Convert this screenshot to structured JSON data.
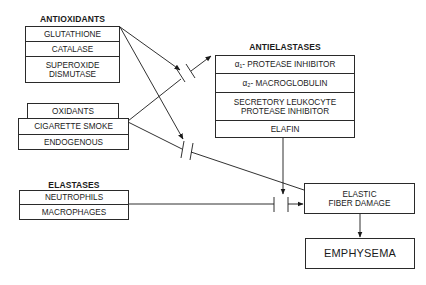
{
  "diagram": {
    "antioxidants": {
      "title": "ANTIOXIDANTS",
      "items": [
        "GLUTATHIONE",
        "CATALASE",
        "SUPEROXIDE\nDISMUTASE"
      ]
    },
    "oxidants": {
      "title": "OXIDANTS",
      "items": [
        "CIGARETTE  SMOKE",
        "ENDOGENOUS"
      ]
    },
    "elastases": {
      "title": "ELASTASES",
      "items": [
        "NEUTROPHILS",
        "MACROPHAGES"
      ]
    },
    "antielastases": {
      "title": "ANTIELASTASES",
      "items": [
        "α₁- PROTEASE  INHIBITOR",
        "α₂- MACROGLOBULIN",
        "SECRETORY  LEUKOCYTE\nPROTEASE  INHIBITOR",
        "ELAFIN"
      ]
    },
    "elastic_fiber_damage": {
      "label": "ELASTIC\nFIBER  DAMAGE"
    },
    "emphysema": {
      "label": "EMPHYSEMA"
    },
    "edges": [
      {
        "from": "antioxidants",
        "to": "oxidants-to-antielastases-link",
        "type": "inhibit"
      },
      {
        "from": "antioxidants",
        "to": "oxidants-to-elastic-fiber-link",
        "type": "inhibit"
      },
      {
        "from": "cigarette-smoke",
        "to": "antielastases",
        "type": "inhibited-arrow"
      },
      {
        "from": "cigarette-smoke",
        "to": "elastic-fiber-damage",
        "type": "inhibited-arrow"
      },
      {
        "from": "antielastases",
        "to": "elastases-to-elastic-fiber-link",
        "type": "inhibit"
      },
      {
        "from": "elastases",
        "to": "elastic-fiber-damage",
        "type": "inhibited-arrow"
      },
      {
        "from": "elastic-fiber-damage",
        "to": "emphysema",
        "type": "arrow"
      }
    ]
  }
}
